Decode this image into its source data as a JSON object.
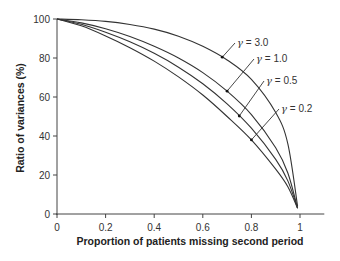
{
  "chart_data": {
    "type": "line",
    "title": "",
    "xlabel": "Proportion of patients missing second period",
    "ylabel": "Ratio of variances (%)",
    "xlim": [
      0,
      1.1
    ],
    "ylim": [
      0,
      100
    ],
    "grid": false,
    "legend": "inline annotations",
    "x_ticks": [
      "0",
      "0.2",
      "0.4",
      "0.6",
      "0.8",
      "1"
    ],
    "y_ticks": [
      "0",
      "20",
      "40",
      "60",
      "80",
      "100"
    ],
    "x": [
      0,
      0.1,
      0.2,
      0.3,
      0.4,
      0.5,
      0.6,
      0.7,
      0.8,
      0.9,
      0.95,
      0.99
    ],
    "series": [
      {
        "name": "γ = 3.0",
        "gamma_symbol": "γ",
        "gamma_value": "= 3.0",
        "values": [
          100,
          99.6,
          98.8,
          97.2,
          94.8,
          91.2,
          86,
          79,
          69,
          52,
          36,
          4
        ]
      },
      {
        "name": "γ = 1.0",
        "gamma_symbol": "γ",
        "gamma_value": "= 1.0",
        "values": [
          100,
          98,
          95,
          91,
          86,
          80,
          72.5,
          63,
          51,
          34,
          21,
          3
        ]
      },
      {
        "name": "γ = 0.5",
        "gamma_symbol": "γ",
        "gamma_value": "= 0.5",
        "values": [
          100,
          97.3,
          93.2,
          88.3,
          82.4,
          75.3,
          66.8,
          56.5,
          44,
          28,
          17,
          3
        ]
      },
      {
        "name": "γ = 0.2",
        "gamma_symbol": "γ",
        "gamma_value": "= 0.2",
        "values": [
          100,
          96.5,
          91.3,
          85.3,
          78.4,
          70.3,
          61,
          50,
          38,
          23,
          14,
          3
        ]
      }
    ],
    "annotations": [
      {
        "label": "γ = 3.0",
        "points_to_series": "γ = 3.0",
        "at_x": 0.68
      },
      {
        "label": "γ = 1.0",
        "points_to_series": "γ = 1.0",
        "at_x": 0.7
      },
      {
        "label": "γ = 0.5",
        "points_to_series": "γ = 0.5",
        "at_x": 0.75
      },
      {
        "label": "γ = 0.2",
        "points_to_series": "γ = 0.2",
        "at_x": 0.8
      }
    ]
  },
  "axes": {
    "x_title": "Proportion of patients missing second period",
    "y_title": "Ratio of variances (%)"
  },
  "style": {
    "line_color": "#333333",
    "axis_color": "#444444"
  }
}
